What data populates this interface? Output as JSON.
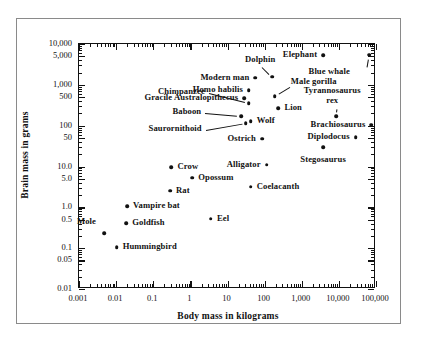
{
  "figure": {
    "axis_titles": {
      "x": "Body mass in kilograms",
      "y": "Brain mass in grams"
    }
  },
  "chart_data": {
    "type": "scatter",
    "title": "",
    "xlabel": "Body mass in kilograms",
    "ylabel": "Brain mass in grams",
    "xscale": "log",
    "yscale": "log",
    "xlim": [
      0.001,
      100000
    ],
    "ylim": [
      0.01,
      10000
    ],
    "grid": false,
    "legend": "none",
    "xticks": [
      "0.001",
      "0.01",
      "0.1",
      "1",
      "10",
      "100",
      "1,000",
      "10,000",
      "100,000"
    ],
    "yticks": [
      "0.01",
      "0.05",
      "0.1",
      "0.5",
      "1.0",
      "5.0",
      "10.0",
      "50",
      "100",
      "500",
      "1,000",
      "5,000",
      "10,000"
    ],
    "points": [
      {
        "label": "Mole",
        "x": 0.005,
        "y": 0.22,
        "label_pos": "right",
        "leader": false
      },
      {
        "label": "Hummingbird",
        "x": 0.011,
        "y": 0.1,
        "label_pos": "left",
        "leader": false
      },
      {
        "label": "Goldfish",
        "x": 0.02,
        "y": 0.38,
        "label_pos": "left",
        "leader": false
      },
      {
        "label": "Vampire bat",
        "x": 0.021,
        "y": 1.0,
        "label_pos": "left",
        "leader": false
      },
      {
        "label": "Rat",
        "x": 0.3,
        "y": 2.4,
        "label_pos": "left",
        "leader": false
      },
      {
        "label": "Crow",
        "x": 0.33,
        "y": 9.0,
        "label_pos": "left",
        "leader": false
      },
      {
        "label": "Opossum",
        "x": 1.2,
        "y": 5.0,
        "label_pos": "left",
        "leader": false
      },
      {
        "label": "Eel",
        "x": 3.8,
        "y": 0.5,
        "label_pos": "left",
        "leader": false
      },
      {
        "label": "Chimpanzee",
        "x": 40,
        "y": 330,
        "label_pos": "right",
        "leader": true
      },
      {
        "label": "Baboon",
        "x": 25,
        "y": 160,
        "label_pos": "right",
        "leader": true
      },
      {
        "label": "Saurornithoid",
        "x": 33,
        "y": 110,
        "label_pos": "right",
        "leader": true
      },
      {
        "label": "Coelacanth",
        "x": 45,
        "y": 3.0,
        "label_pos": "left",
        "leader": false
      },
      {
        "label": "Gracile Australopithecus",
        "x": 30,
        "y": 440,
        "label_pos": "right",
        "leader": false
      },
      {
        "label": "Homo habilis",
        "x": 40,
        "y": 700,
        "label_pos": "right",
        "leader": false
      },
      {
        "label": "Modern man",
        "x": 60,
        "y": 1400,
        "label_pos": "right",
        "leader": false
      },
      {
        "label": "Wolf",
        "x": 45,
        "y": 120,
        "label_pos": "left",
        "leader": false
      },
      {
        "label": "Ostrich",
        "x": 90,
        "y": 45,
        "label_pos": "right",
        "leader": false
      },
      {
        "label": "Alligator",
        "x": 120,
        "y": 10.5,
        "label_pos": "right",
        "leader": false
      },
      {
        "label": "Dolphin",
        "x": 170,
        "y": 1500,
        "label_pos": "center",
        "leader": true
      },
      {
        "label": "Male gorilla",
        "x": 200,
        "y": 500,
        "label_pos": "left",
        "leader": true
      },
      {
        "label": "Lion",
        "x": 250,
        "y": 250,
        "label_pos": "left",
        "leader": false
      },
      {
        "label": "Elephant",
        "x": 4000,
        "y": 5000,
        "label_pos": "right",
        "leader": false
      },
      {
        "label": "Stegosaurus",
        "x": 4000,
        "y": 28,
        "label_pos": "center",
        "leader": false
      },
      {
        "label": "Tyrannosaurus rex",
        "x": 9000,
        "y": 160,
        "label_pos": "center",
        "leader": true
      },
      {
        "label": "Brachiosaurus",
        "x": 80000,
        "y": 100,
        "label_pos": "right",
        "leader": false
      },
      {
        "label": "Diplodocus",
        "x": 30000,
        "y": 50,
        "label_pos": "right",
        "leader": false
      },
      {
        "label": "Blue whale",
        "x": 70000,
        "y": 5200,
        "label_pos": "center",
        "leader": true
      }
    ]
  }
}
